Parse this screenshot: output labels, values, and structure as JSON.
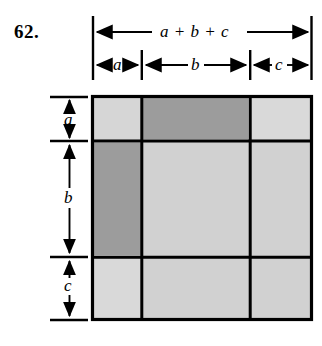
{
  "figure": {
    "problem_number": "62.",
    "top_rulers": [
      {
        "id": "total-width",
        "label": "a + b + c",
        "span": "full"
      },
      {
        "id": "segment-a",
        "label": "a",
        "span": "a"
      },
      {
        "id": "segment-b",
        "label": "b",
        "span": "b"
      },
      {
        "id": "segment-c",
        "label": "c",
        "span": "c"
      }
    ],
    "left_rulers": [
      {
        "id": "height-a",
        "label": "a"
      },
      {
        "id": "height-b",
        "label": "b"
      },
      {
        "id": "height-c",
        "label": "c"
      }
    ],
    "colors": {
      "light_fill": "#d2d2d2",
      "dark_fill": "#9c9c9c",
      "stroke": "#000000",
      "background": "#ffffff"
    },
    "grid": {
      "columns": [
        "a",
        "b",
        "c"
      ],
      "rows": [
        "a",
        "b",
        "c"
      ],
      "cells": [
        {
          "row": "a",
          "col": "a",
          "shade": "light",
          "name": "cell-a-a"
        },
        {
          "row": "a",
          "col": "b",
          "shade": "dark",
          "name": "cell-a-b"
        },
        {
          "row": "a",
          "col": "c",
          "shade": "light",
          "name": "cell-a-c"
        },
        {
          "row": "b",
          "col": "a",
          "shade": "dark",
          "name": "cell-b-a"
        },
        {
          "row": "b",
          "col": "b",
          "shade": "light",
          "name": "cell-b-b"
        },
        {
          "row": "b",
          "col": "c",
          "shade": "light",
          "name": "cell-b-c"
        },
        {
          "row": "c",
          "col": "a",
          "shade": "light",
          "name": "cell-c-a"
        },
        {
          "row": "c",
          "col": "b",
          "shade": "light",
          "name": "cell-c-b"
        },
        {
          "row": "c",
          "col": "c",
          "shade": "light",
          "name": "cell-c-c"
        }
      ]
    }
  }
}
